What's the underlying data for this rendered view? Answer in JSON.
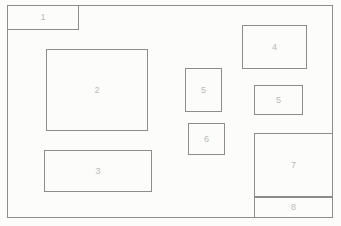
{
  "diagram": {
    "colors": {
      "line": "#8a8d8a",
      "label": "#b7bbb7",
      "paper": "#fcfcfa"
    },
    "boxes": [
      {
        "id": "1",
        "label": "1"
      },
      {
        "id": "2",
        "label": "2"
      },
      {
        "id": "3",
        "label": "3"
      },
      {
        "id": "4",
        "label": "4"
      },
      {
        "id": "5a",
        "label": "5"
      },
      {
        "id": "5b",
        "label": "5"
      },
      {
        "id": "6",
        "label": "6"
      },
      {
        "id": "7",
        "label": "7"
      },
      {
        "id": "8",
        "label": "8"
      }
    ]
  }
}
